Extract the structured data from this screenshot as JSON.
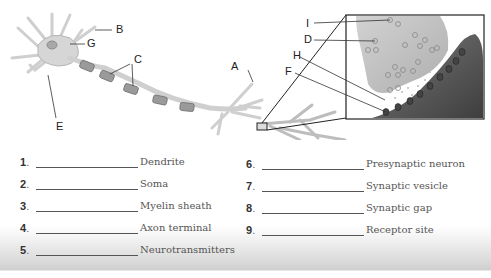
{
  "diagram": {
    "labels": [
      {
        "id": "A",
        "text": "A"
      },
      {
        "id": "B",
        "text": "B"
      },
      {
        "id": "C",
        "text": "C"
      },
      {
        "id": "D",
        "text": "D"
      },
      {
        "id": "E",
        "text": "E"
      },
      {
        "id": "F",
        "text": "F"
      },
      {
        "id": "G",
        "text": "G"
      },
      {
        "id": "H",
        "text": "H"
      },
      {
        "id": "I",
        "text": "I"
      }
    ],
    "colors": {
      "neuron_fill": "#d9d9d9",
      "neuron_stroke": "#9a9a9a",
      "myelin": "#8c8c8c",
      "presynaptic": "#c4c4c4",
      "postsynaptic": "#5a5a5a",
      "box_stroke": "#222222"
    }
  },
  "matching": {
    "left": [
      {
        "num": "1",
        "term": "Dendrite"
      },
      {
        "num": "2",
        "term": "Soma"
      },
      {
        "num": "3",
        "term": "Myelin sheath"
      },
      {
        "num": "4",
        "term": "Axon terminal"
      },
      {
        "num": "5",
        "term": "Neurotransmitters"
      }
    ],
    "right": [
      {
        "num": "6",
        "term": "Presynaptic neuron"
      },
      {
        "num": "7",
        "term": "Synaptic vesicle"
      },
      {
        "num": "8",
        "term": "Synaptic gap"
      },
      {
        "num": "9",
        "term": "Receptor site"
      }
    ],
    "dot": "."
  }
}
